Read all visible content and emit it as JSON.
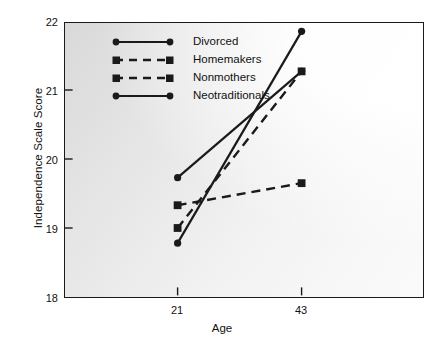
{
  "chart_data": {
    "type": "line",
    "title": "",
    "xlabel": "Age",
    "ylabel": "Independence Scale Score",
    "x": [
      21,
      43
    ],
    "xticks": [
      21,
      43
    ],
    "xtick_labels": [
      "21",
      "43"
    ],
    "yticks": [
      18,
      19,
      20,
      21,
      22
    ],
    "ytick_labels": [
      "18",
      "19",
      "20",
      "21",
      "22"
    ],
    "ylim": [
      18,
      22
    ],
    "xlim": [
      0,
      100
    ],
    "grid": false,
    "legend_position": "top-left-inside",
    "series": [
      {
        "name": "Divorced",
        "values": [
          19.73,
          21.27
        ],
        "linestyle": "solid",
        "marker": "circle",
        "color": "#1a1a1a"
      },
      {
        "name": "Homemakers",
        "values": [
          19.0,
          21.27
        ],
        "linestyle": "dashed",
        "marker": "square",
        "color": "#1a1a1a"
      },
      {
        "name": "Nonmothers",
        "values": [
          19.33,
          19.65
        ],
        "linestyle": "dashed",
        "marker": "square",
        "color": "#1a1a1a"
      },
      {
        "name": "Neotraditionals",
        "values": [
          18.78,
          21.85
        ],
        "linestyle": "solid",
        "marker": "circle",
        "color": "#1a1a1a"
      }
    ]
  },
  "colors": {
    "line": "#1a1a1a",
    "frame": "#1a1a1a",
    "text": "#111111",
    "panel_light": "#fafafa",
    "panel_dark": "#d9d9d9"
  }
}
